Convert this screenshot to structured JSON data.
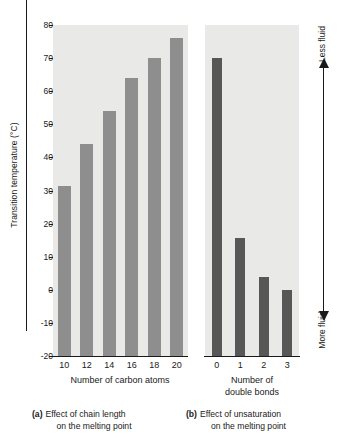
{
  "figure": {
    "y_axis_title": "Transition temperature (°C)",
    "fluidity_axis": {
      "top_label": "Less fluid",
      "bottom_label": "More fluid",
      "arrow": "double-headed-vertical-arrow"
    }
  },
  "chart_data": [
    {
      "type": "bar",
      "panel": "a",
      "title": "",
      "xlabel": "Number of carbon atoms",
      "ylabel": "Transition temperature (°C)",
      "categories": [
        "10",
        "12",
        "14",
        "16",
        "18",
        "20"
      ],
      "values": [
        31.5,
        44,
        54,
        64,
        70,
        76
      ],
      "ylim": [
        -20,
        80
      ],
      "yticks": [
        80,
        70,
        60,
        50,
        40,
        30,
        20,
        10,
        0,
        -10,
        -20
      ],
      "grid": false,
      "bar_color": "#8e8e8e",
      "panel_background": "#e9e9e7",
      "caption_tag": "(a)",
      "caption_line1": "Effect of chain length",
      "caption_line2": "on the melting point"
    },
    {
      "type": "bar",
      "panel": "b",
      "title": "",
      "xlabel_line1": "Number of",
      "xlabel_line2": "double bonds",
      "ylabel": "Transition temperature (°C)",
      "categories": [
        "0",
        "1",
        "2",
        "3"
      ],
      "values": [
        70,
        15.5,
        4,
        -10.5
      ],
      "ylim": [
        -20,
        80
      ],
      "yticks": [
        80,
        70,
        60,
        50,
        40,
        30,
        20,
        10,
        0,
        -10,
        -20
      ],
      "grid": false,
      "bar_color": "#575757",
      "panel_background": "#e9e9e7",
      "caption_tag": "(b)",
      "caption_line1": "Effect of unsaturation",
      "caption_line2": "on the melting point"
    }
  ]
}
